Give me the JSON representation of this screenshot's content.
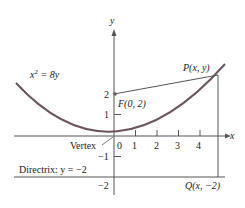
{
  "diagram": {
    "equation": {
      "base": "x",
      "exp": "2",
      "rest": " = 8y"
    },
    "axes": {
      "x_label": "x",
      "y_label": "y"
    },
    "x_ticks": [
      "0",
      "1",
      "2",
      "3",
      "4"
    ],
    "y_ticks": [
      "2",
      "1",
      "−1",
      "−2"
    ],
    "focus": {
      "label": "F(0, 2)"
    },
    "point": {
      "label": "P(x, y)"
    },
    "projection": {
      "label": "Q(x, −2)"
    },
    "vertex": {
      "label": "Vertex"
    },
    "directrix": {
      "label": "Directrix: y = −2"
    },
    "colors": {
      "curve": "#6b5560",
      "lines": "#555555",
      "text": "#222222"
    }
  }
}
